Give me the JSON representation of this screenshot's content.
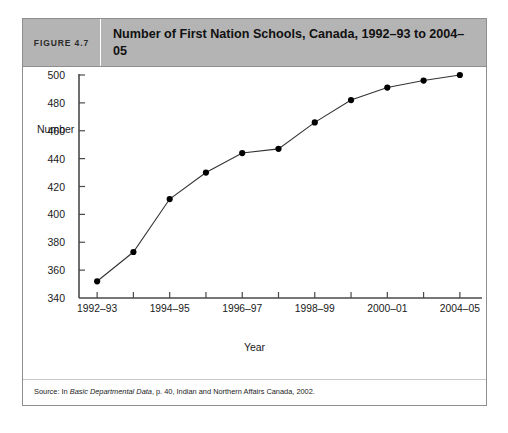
{
  "figure": {
    "number_label": "FIGURE 4.7",
    "title": "Number of First Nation Schools, Canada, 1992–93 to 2004–05",
    "source_prefix": "Source: In ",
    "source_italic": "Basic Departmental Data",
    "source_suffix": ",  p. 40, Indian and Northern Affairs Canada, 2002.",
    "header_bg": "#b4b4b4",
    "border_color": "#8e8e8e"
  },
  "chart_data": {
    "type": "line",
    "title": "Number of First Nation Schools, Canada, 1992–93 to 2004–05",
    "xlabel": "Year",
    "ylabel": "Number",
    "ylim": [
      340,
      500
    ],
    "ytick_step": 20,
    "yticks": [
      340,
      360,
      380,
      400,
      420,
      440,
      460,
      480,
      500
    ],
    "ytick_labels": [
      "340",
      "360",
      "380",
      "400",
      "420",
      "440",
      "460",
      "480",
      "500"
    ],
    "grid": false,
    "legend": "none",
    "marker": "filled-circle",
    "line_color": "#333333",
    "marker_color": "#000000",
    "categories": [
      "1992–93",
      "1993–94",
      "1994–95",
      "1995–96",
      "1996–97",
      "1997–98",
      "1998–99",
      "1999–00",
      "2000–01",
      "2002–03",
      "2004–05"
    ],
    "xtick_labels_shown": [
      "1992–93",
      "1994–95",
      "1996–97",
      "1998–99",
      "2000–01",
      "2004–05"
    ],
    "xtick_label_indices": [
      0,
      2,
      4,
      6,
      8,
      10
    ],
    "values": [
      352,
      373,
      411,
      430,
      444,
      447,
      466,
      482,
      491,
      496,
      500
    ]
  }
}
